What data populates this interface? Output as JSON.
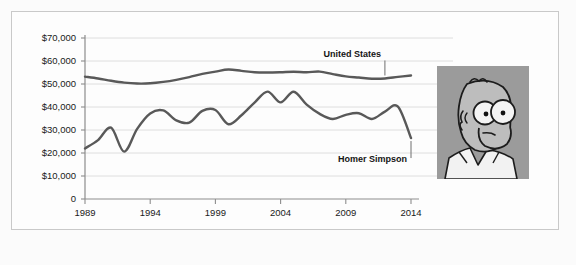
{
  "figure": {
    "background_color": "#fbfbfb",
    "frame_color": "#c9c9c9"
  },
  "photo": {
    "name": "homer-simpson-portrait",
    "alt_text": "Homer Simpson",
    "background_color": "#9b9b9b",
    "skin_color": "#bdbdbd",
    "outline_color": "#1c1c1c",
    "shirt_color": "#f2f2f2"
  },
  "chart_data": {
    "type": "line",
    "title": "",
    "subtitle": "",
    "xlabel": "",
    "ylabel": "",
    "xlim": [
      1989,
      2014
    ],
    "ylim": [
      0,
      70000
    ],
    "grid": true,
    "legend_position": "annotated-inline",
    "y_tick_labels": [
      "$70,000",
      "$60,000",
      "$50,000",
      "$40,000",
      "$30,000",
      "$20,000",
      "$10,000",
      "0"
    ],
    "y_tick_values": [
      70000,
      60000,
      50000,
      40000,
      30000,
      20000,
      10000,
      0
    ],
    "x_tick_labels": [
      "1989",
      "1994",
      "1999",
      "2004",
      "2009",
      "2014"
    ],
    "x_tick_values": [
      1989,
      1994,
      1999,
      2004,
      2009,
      2014
    ],
    "x": [
      1989,
      1990,
      1991,
      1992,
      1993,
      1994,
      1995,
      1996,
      1997,
      1998,
      1999,
      2000,
      2001,
      2002,
      2003,
      2004,
      2005,
      2006,
      2007,
      2008,
      2009,
      2010,
      2011,
      2012,
      2013,
      2014
    ],
    "series": [
      {
        "name": "United States",
        "color": "#595959",
        "label_text": "United States",
        "values": [
          53200,
          52400,
          51400,
          50600,
          50200,
          50300,
          50900,
          51800,
          53000,
          54400,
          55400,
          56300,
          55700,
          55100,
          55000,
          55100,
          55300,
          55100,
          55400,
          54300,
          53300,
          52800,
          52300,
          52400,
          53100,
          53700
        ]
      },
      {
        "name": "Homer Simpson",
        "color": "#595959",
        "label_text": "Homer Simpson",
        "values": [
          22000,
          25600,
          31000,
          20600,
          30500,
          37200,
          38500,
          34200,
          33200,
          38300,
          38700,
          32500,
          36400,
          41900,
          46700,
          42000,
          46600,
          41000,
          37000,
          34800,
          36600,
          37300,
          34800,
          38000,
          40200,
          26500
        ]
      }
    ],
    "annotations": [
      {
        "text": "United States",
        "for_series": "United States",
        "at_x": 2012,
        "placement": "above"
      },
      {
        "text": "Homer Simpson",
        "for_series": "Homer Simpson",
        "at_x": 2014,
        "placement": "below"
      }
    ]
  }
}
